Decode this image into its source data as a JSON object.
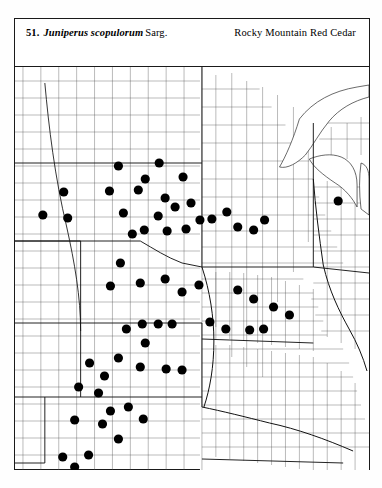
{
  "plate": {
    "number": "51.",
    "scientific_name": "Juniperus scopulorum",
    "authority": "Sarg.",
    "common_name": "Rocky Mountain Red Cedar"
  },
  "map": {
    "type": "county-distribution-dot-map",
    "region": "Great Plains and Upper Midwest, United States",
    "symbol": "filled-black-circle",
    "symbol_meaning": "county occurrence record",
    "dot_radius_px": 4.6,
    "frame": {
      "x": 14,
      "y": 18,
      "width": 356,
      "height": 452
    },
    "map_viewport": {
      "x": 0,
      "y": 48,
      "width": 356,
      "height": 403
    },
    "states_depicted": [
      "North Dakota",
      "South Dakota",
      "Nebraska",
      "Kansas",
      "Oklahoma",
      "Colorado",
      "Minnesota",
      "Iowa",
      "Missouri",
      "Wisconsin",
      "Michigan"
    ],
    "dot_count": 64,
    "dots": [
      [
        104,
        99
      ],
      [
        145,
        96
      ],
      [
        131,
        112
      ],
      [
        124,
        123
      ],
      [
        169,
        110
      ],
      [
        49,
        125
      ],
      [
        95,
        124
      ],
      [
        53,
        151
      ],
      [
        109,
        146
      ],
      [
        144,
        149
      ],
      [
        151,
        131
      ],
      [
        153,
        164
      ],
      [
        161,
        140
      ],
      [
        130,
        163
      ],
      [
        177,
        136
      ],
      [
        28,
        148
      ],
      [
        172,
        162
      ],
      [
        186,
        153
      ],
      [
        118,
        167
      ],
      [
        198,
        152
      ],
      [
        213,
        145
      ],
      [
        224,
        160
      ],
      [
        240,
        163
      ],
      [
        251,
        153
      ],
      [
        325,
        134
      ],
      [
        106,
        196
      ],
      [
        96,
        219
      ],
      [
        126,
        216
      ],
      [
        151,
        212
      ],
      [
        168,
        225
      ],
      [
        185,
        218
      ],
      [
        224,
        223
      ],
      [
        240,
        232
      ],
      [
        260,
        240
      ],
      [
        276,
        248
      ],
      [
        128,
        257
      ],
      [
        144,
        257
      ],
      [
        158,
        257
      ],
      [
        112,
        262
      ],
      [
        131,
        276
      ],
      [
        104,
        291
      ],
      [
        75,
        296
      ],
      [
        90,
        309
      ],
      [
        64,
        320
      ],
      [
        84,
        326
      ],
      [
        126,
        300
      ],
      [
        152,
        302
      ],
      [
        168,
        303
      ],
      [
        114,
        340
      ],
      [
        96,
        344
      ],
      [
        60,
        353
      ],
      [
        88,
        357
      ],
      [
        129,
        352
      ],
      [
        104,
        372
      ],
      [
        48,
        390
      ],
      [
        74,
        388
      ],
      [
        60,
        400
      ],
      [
        117,
        431
      ],
      [
        131,
        431
      ],
      [
        127,
        443
      ],
      [
        196,
        255
      ],
      [
        212,
        262
      ],
      [
        236,
        263
      ],
      [
        250,
        262
      ]
    ]
  }
}
